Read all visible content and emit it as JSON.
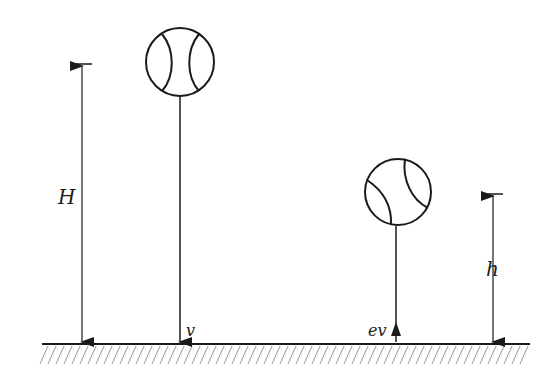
{
  "diagram": {
    "type": "physics-bouncing-ball",
    "labels": {
      "H": "H",
      "h": "h",
      "v": "v",
      "ev": "ev"
    },
    "colors": {
      "stroke": "#1a1a1a",
      "hatch": "#9a9a9a",
      "background": "#ffffff"
    }
  }
}
